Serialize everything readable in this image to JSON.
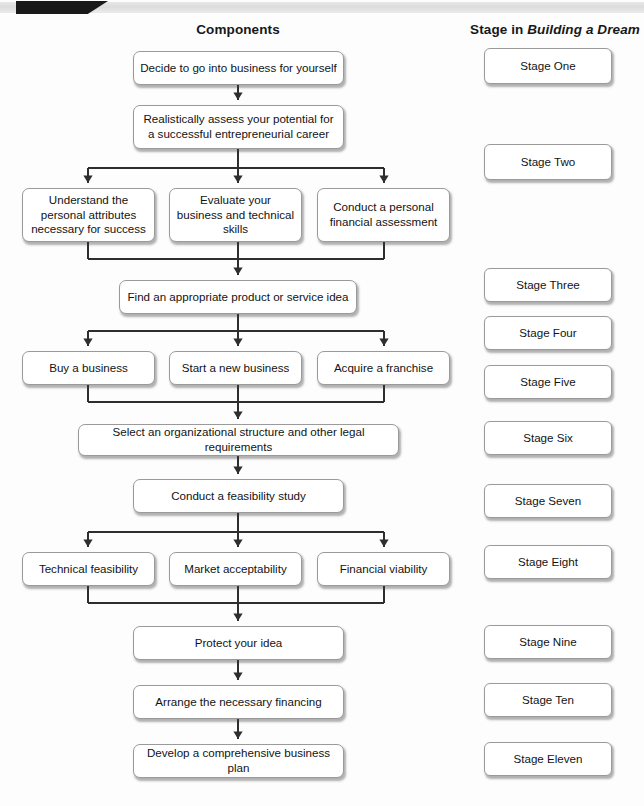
{
  "figure": {
    "headers": {
      "components": "Components",
      "stage_prefix": "Stage in ",
      "stage_italic": "Building a Dream"
    }
  },
  "flow": {
    "nodes": [
      {
        "id": "decide",
        "label": "Decide to go into business for yourself",
        "x": 133,
        "y": 51,
        "w": 211,
        "h": 34
      },
      {
        "id": "assess",
        "label": "Realistically assess your potential for a successful entrepreneurial career",
        "x": 133,
        "y": 105,
        "w": 211,
        "h": 44
      },
      {
        "id": "understand",
        "label": "Understand the personal attributes necessary for success",
        "x": 22,
        "y": 188,
        "w": 133,
        "h": 54
      },
      {
        "id": "evaluate",
        "label": "Evaluate your business and technical skills",
        "x": 169,
        "y": 188,
        "w": 133,
        "h": 54
      },
      {
        "id": "financial",
        "label": "Conduct a personal financial assessment",
        "x": 317,
        "y": 188,
        "w": 133,
        "h": 54
      },
      {
        "id": "find-idea",
        "label": "Find an appropriate product or service idea",
        "x": 119,
        "y": 280,
        "w": 238,
        "h": 34
      },
      {
        "id": "buy",
        "label": "Buy a business",
        "x": 22,
        "y": 351,
        "w": 133,
        "h": 34
      },
      {
        "id": "start",
        "label": "Start a new business",
        "x": 169,
        "y": 351,
        "w": 133,
        "h": 34
      },
      {
        "id": "franchise",
        "label": "Acquire a franchise",
        "x": 317,
        "y": 351,
        "w": 133,
        "h": 34
      },
      {
        "id": "structure",
        "label": "Select an organizational structure and other legal requirements",
        "x": 78,
        "y": 424,
        "w": 321,
        "h": 32
      },
      {
        "id": "feasibility",
        "label": "Conduct a feasibility study",
        "x": 133,
        "y": 479,
        "w": 211,
        "h": 34
      },
      {
        "id": "technical",
        "label": "Technical feasibility",
        "x": 22,
        "y": 552,
        "w": 133,
        "h": 34
      },
      {
        "id": "market",
        "label": "Market acceptability",
        "x": 169,
        "y": 552,
        "w": 133,
        "h": 34
      },
      {
        "id": "viability",
        "label": "Financial viability",
        "x": 317,
        "y": 552,
        "w": 133,
        "h": 34
      },
      {
        "id": "protect",
        "label": "Protect your idea",
        "x": 133,
        "y": 626,
        "w": 211,
        "h": 34
      },
      {
        "id": "finance",
        "label": "Arrange the necessary financing",
        "x": 133,
        "y": 685,
        "w": 211,
        "h": 34
      },
      {
        "id": "plan",
        "label": "Develop a comprehensive business plan",
        "x": 133,
        "y": 744,
        "w": 211,
        "h": 34
      }
    ]
  },
  "stages": {
    "boxes": [
      {
        "label": "Stage One",
        "x": 484,
        "y": 48,
        "w": 128,
        "h": 36
      },
      {
        "label": "Stage Two",
        "x": 484,
        "y": 144,
        "w": 128,
        "h": 36
      },
      {
        "label": "Stage Three",
        "x": 484,
        "y": 268,
        "w": 128,
        "h": 34
      },
      {
        "label": "Stage Four",
        "x": 484,
        "y": 316,
        "w": 128,
        "h": 34
      },
      {
        "label": "Stage Five",
        "x": 484,
        "y": 365,
        "w": 128,
        "h": 34
      },
      {
        "label": "Stage Six",
        "x": 484,
        "y": 421,
        "w": 128,
        "h": 34
      },
      {
        "label": "Stage Seven",
        "x": 484,
        "y": 484,
        "w": 128,
        "h": 34
      },
      {
        "label": "Stage Eight",
        "x": 484,
        "y": 545,
        "w": 128,
        "h": 34
      },
      {
        "label": "Stage Nine",
        "x": 484,
        "y": 625,
        "w": 128,
        "h": 34
      },
      {
        "label": "Stage Ten",
        "x": 484,
        "y": 683,
        "w": 128,
        "h": 34
      },
      {
        "label": "Stage Eleven",
        "x": 484,
        "y": 742,
        "w": 128,
        "h": 34
      }
    ]
  },
  "connectors": {
    "stroke": "#2e2e2e",
    "vertical": [
      {
        "x": 238,
        "y1": 85,
        "y2": 100
      },
      {
        "x": 238,
        "y1": 149,
        "y2": 168
      },
      {
        "x": 88,
        "y1": 168,
        "y2": 183
      },
      {
        "x": 238,
        "y1": 168,
        "y2": 183
      },
      {
        "x": 384,
        "y1": 168,
        "y2": 183
      },
      {
        "x": 88,
        "y1": 242,
        "y2": 259
      },
      {
        "x": 384,
        "y1": 242,
        "y2": 259
      },
      {
        "x": 238,
        "y1": 242,
        "y2": 275
      },
      {
        "x": 238,
        "y1": 314,
        "y2": 331
      },
      {
        "x": 88,
        "y1": 331,
        "y2": 346
      },
      {
        "x": 238,
        "y1": 331,
        "y2": 346
      },
      {
        "x": 384,
        "y1": 331,
        "y2": 346
      },
      {
        "x": 88,
        "y1": 385,
        "y2": 402
      },
      {
        "x": 384,
        "y1": 385,
        "y2": 402
      },
      {
        "x": 238,
        "y1": 385,
        "y2": 419
      },
      {
        "x": 238,
        "y1": 456,
        "y2": 474
      },
      {
        "x": 238,
        "y1": 513,
        "y2": 532
      },
      {
        "x": 88,
        "y1": 532,
        "y2": 547
      },
      {
        "x": 238,
        "y1": 532,
        "y2": 547
      },
      {
        "x": 384,
        "y1": 532,
        "y2": 547
      },
      {
        "x": 88,
        "y1": 586,
        "y2": 603
      },
      {
        "x": 384,
        "y1": 586,
        "y2": 603
      },
      {
        "x": 238,
        "y1": 586,
        "y2": 621
      },
      {
        "x": 238,
        "y1": 660,
        "y2": 680
      },
      {
        "x": 238,
        "y1": 719,
        "y2": 739
      }
    ],
    "horizontal": [
      {
        "y": 168,
        "x1": 88,
        "x2": 384
      },
      {
        "y": 259,
        "x1": 88,
        "x2": 384
      },
      {
        "y": 331,
        "x1": 88,
        "x2": 384
      },
      {
        "y": 402,
        "x1": 88,
        "x2": 384
      },
      {
        "y": 532,
        "x1": 88,
        "x2": 384
      },
      {
        "y": 603,
        "x1": 88,
        "x2": 384
      }
    ],
    "arrows": [
      {
        "x": 238,
        "y": 100
      },
      {
        "x": 88,
        "y": 183
      },
      {
        "x": 238,
        "y": 183
      },
      {
        "x": 384,
        "y": 183
      },
      {
        "x": 238,
        "y": 275
      },
      {
        "x": 88,
        "y": 346
      },
      {
        "x": 238,
        "y": 346
      },
      {
        "x": 384,
        "y": 346
      },
      {
        "x": 238,
        "y": 419
      },
      {
        "x": 238,
        "y": 474
      },
      {
        "x": 88,
        "y": 547
      },
      {
        "x": 238,
        "y": 547
      },
      {
        "x": 384,
        "y": 547
      },
      {
        "x": 238,
        "y": 621
      },
      {
        "x": 238,
        "y": 680
      },
      {
        "x": 238,
        "y": 739
      }
    ]
  }
}
